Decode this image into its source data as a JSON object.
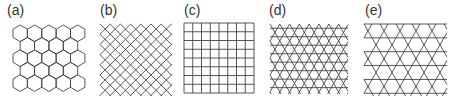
{
  "figure": {
    "panels": [
      {
        "id": "a",
        "label": "(a)",
        "pattern": "honeycomb"
      },
      {
        "id": "b",
        "label": "(b)",
        "pattern": "diagonal-square"
      },
      {
        "id": "c",
        "label": "(c)",
        "pattern": "square"
      },
      {
        "id": "d",
        "label": "(d)",
        "pattern": "triangular"
      },
      {
        "id": "e",
        "label": "(e)",
        "pattern": "kagome"
      }
    ],
    "stroke_color": "#444444"
  }
}
